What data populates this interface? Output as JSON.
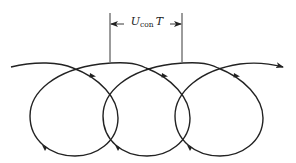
{
  "diagram": {
    "type": "trajectory-loops",
    "dimension_label": {
      "symbol": "U",
      "subscript": "con",
      "suffix": "T"
    },
    "loop_count": 3,
    "stroke_color": "#222222",
    "background": "#ffffff"
  }
}
